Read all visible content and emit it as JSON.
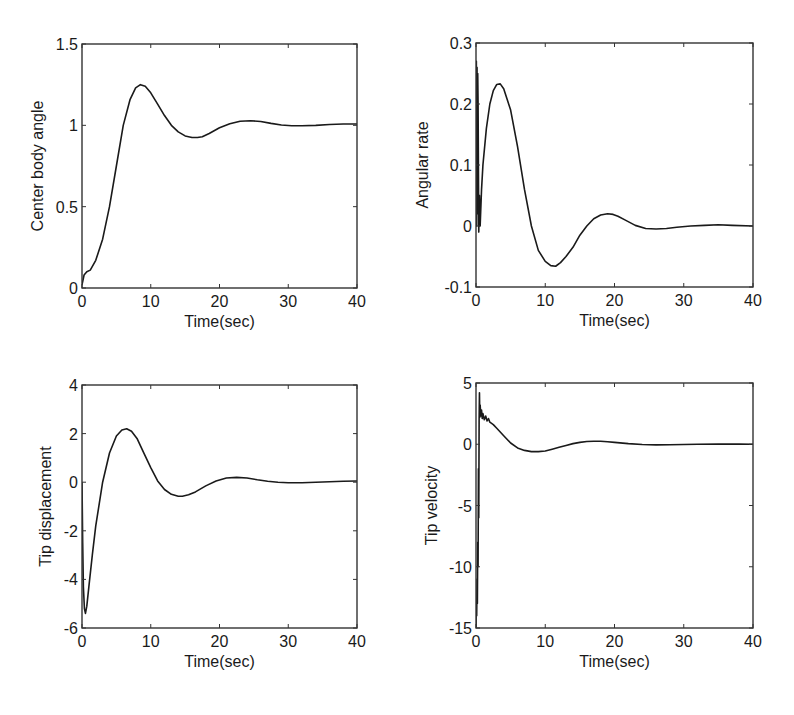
{
  "figure": {
    "line_color": "#1a1a1a",
    "axes_color": "#333333",
    "background": "#ffffff"
  },
  "chart_data": [
    {
      "id": "center_body_angle",
      "type": "line",
      "title": "",
      "xlabel": "Time(sec)",
      "ylabel": "Center body angle",
      "xlim": [
        0,
        40
      ],
      "ylim": [
        0,
        1.5
      ],
      "xticks": [
        0,
        10,
        20,
        30,
        40
      ],
      "xtick_labels": [
        "0",
        "10",
        "20",
        "30",
        "40"
      ],
      "yticks": [
        0,
        0.5,
        1,
        1.5
      ],
      "ytick_labels": [
        "0",
        "0.5",
        "1",
        "1.5"
      ],
      "grid": false,
      "box": {
        "left": 82,
        "top": 44,
        "right": 357,
        "bottom": 288
      },
      "series": [
        {
          "name": "Center body angle",
          "x": [
            0,
            0.3,
            0.7,
            1.2,
            2,
            3,
            4,
            5,
            6,
            7,
            7.8,
            8.5,
            9.2,
            10,
            11,
            12,
            13,
            14,
            15,
            16,
            16.8,
            17.5,
            18.5,
            20,
            21.5,
            23,
            24.5,
            26,
            27.5,
            29,
            30.5,
            32,
            34,
            36,
            38,
            40
          ],
          "y": [
            0.02,
            0.08,
            0.1,
            0.11,
            0.17,
            0.3,
            0.5,
            0.75,
            1.0,
            1.16,
            1.23,
            1.25,
            1.24,
            1.2,
            1.13,
            1.06,
            1.0,
            0.96,
            0.935,
            0.925,
            0.925,
            0.93,
            0.95,
            0.985,
            1.01,
            1.025,
            1.028,
            1.024,
            1.012,
            1.002,
            0.997,
            0.997,
            1.0,
            1.005,
            1.008,
            1.008
          ]
        }
      ]
    },
    {
      "id": "angular_rate",
      "type": "line",
      "title": "",
      "xlabel": "Time(sec)",
      "ylabel": "Angular rate",
      "xlim": [
        0,
        40
      ],
      "ylim": [
        -0.1,
        0.3
      ],
      "xticks": [
        0,
        10,
        20,
        30,
        40
      ],
      "xtick_labels": [
        "0",
        "10",
        "20",
        "30",
        "40"
      ],
      "yticks": [
        -0.1,
        0,
        0.1,
        0.2,
        0.3
      ],
      "ytick_labels": [
        "-0.1",
        "0",
        "0.1",
        "0.2",
        "0.3"
      ],
      "grid": false,
      "box": {
        "left": 476,
        "top": 43,
        "right": 753,
        "bottom": 287
      },
      "series": [
        {
          "name": "Angular rate",
          "x": [
            0,
            0.05,
            0.1,
            0.15,
            0.2,
            0.25,
            0.3,
            0.4,
            0.5,
            0.6,
            0.8,
            1.0,
            1.5,
            2,
            2.5,
            3,
            3.5,
            4,
            5,
            6,
            7,
            8,
            9,
            10,
            10.8,
            11.5,
            12.2,
            13,
            14,
            15,
            16,
            17,
            18,
            19,
            19.8,
            20.5,
            21.5,
            23,
            24.5,
            26,
            27.5,
            29,
            31,
            33,
            35,
            37,
            40
          ],
          "y": [
            0.0,
            0.27,
            0.0,
            0.26,
            0.02,
            0.25,
            0.2,
            -0.01,
            0.05,
            0.0,
            0.06,
            0.1,
            0.16,
            0.2,
            0.222,
            0.232,
            0.233,
            0.225,
            0.19,
            0.13,
            0.06,
            0.0,
            -0.04,
            -0.058,
            -0.065,
            -0.066,
            -0.06,
            -0.05,
            -0.035,
            -0.015,
            0.0,
            0.012,
            0.018,
            0.02,
            0.019,
            0.016,
            0.01,
            0.001,
            -0.004,
            -0.005,
            -0.004,
            -0.002,
            0.0,
            0.001,
            0.002,
            0.001,
            0.0
          ]
        }
      ]
    },
    {
      "id": "tip_displacement",
      "type": "line",
      "title": "",
      "xlabel": "Time(sec)",
      "ylabel": "Tip displacement",
      "xlim": [
        0,
        40
      ],
      "ylim": [
        -6,
        4
      ],
      "xticks": [
        0,
        10,
        20,
        30,
        40
      ],
      "xtick_labels": [
        "0",
        "10",
        "20",
        "30",
        "40"
      ],
      "yticks": [
        -6,
        -4,
        -2,
        0,
        2,
        4
      ],
      "ytick_labels": [
        "-6",
        "-4",
        "-2",
        "0",
        "2",
        "4"
      ],
      "grid": false,
      "box": {
        "left": 82,
        "top": 385,
        "right": 357,
        "bottom": 628
      },
      "series": [
        {
          "name": "Tip displacement",
          "x": [
            0,
            0.1,
            0.2,
            0.35,
            0.5,
            0.7,
            1.0,
            1.5,
            2,
            3,
            4,
            5,
            5.8,
            6.5,
            7.2,
            8,
            9,
            10,
            11,
            12,
            13,
            14,
            14.6,
            15.5,
            16.5,
            18,
            19.5,
            21,
            22.5,
            24,
            25.5,
            27,
            28.5,
            30,
            32,
            34,
            36,
            38,
            40
          ],
          "y": [
            0.0,
            -2.5,
            -4.3,
            -5.2,
            -5.4,
            -5.1,
            -4.3,
            -3.0,
            -1.8,
            0.0,
            1.2,
            1.9,
            2.15,
            2.2,
            2.1,
            1.8,
            1.2,
            0.6,
            0.05,
            -0.3,
            -0.5,
            -0.58,
            -0.58,
            -0.52,
            -0.4,
            -0.15,
            0.05,
            0.17,
            0.2,
            0.17,
            0.1,
            0.04,
            0.0,
            -0.02,
            -0.02,
            0.0,
            0.02,
            0.04,
            0.05
          ]
        }
      ]
    },
    {
      "id": "tip_velocity",
      "type": "line",
      "title": "",
      "xlabel": "Time(sec)",
      "ylabel": "Tip velocity",
      "xlim": [
        0,
        40
      ],
      "ylim": [
        -15,
        5
      ],
      "xticks": [
        0,
        10,
        20,
        30,
        40
      ],
      "xtick_labels": [
        "0",
        "10",
        "20",
        "30",
        "40"
      ],
      "yticks": [
        -15,
        -10,
        -5,
        0,
        5
      ],
      "ytick_labels": [
        "-15",
        "-10",
        "-5",
        "0",
        "5"
      ],
      "grid": false,
      "box": {
        "left": 476,
        "top": 383,
        "right": 753,
        "bottom": 628
      },
      "series": [
        {
          "name": "Tip velocity",
          "x": [
            0,
            0.05,
            0.1,
            0.15,
            0.2,
            0.25,
            0.3,
            0.35,
            0.4,
            0.45,
            0.5,
            0.55,
            0.6,
            0.7,
            0.8,
            0.9,
            1.0,
            1.2,
            1.4,
            1.6,
            1.8,
            2.0,
            2.5,
            3,
            4,
            5,
            6,
            7,
            8,
            9,
            10,
            11,
            12,
            13,
            14,
            15,
            16,
            17,
            18,
            19,
            20,
            22,
            24,
            26,
            28,
            30,
            32,
            35,
            38,
            40
          ],
          "y": [
            -15,
            -13,
            -14,
            -11,
            -13,
            -8,
            -10,
            -2,
            -6,
            2,
            4.2,
            2.2,
            3.2,
            2.3,
            2.8,
            2.1,
            2.5,
            2.0,
            2.3,
            1.9,
            2.1,
            1.8,
            1.6,
            1.3,
            0.7,
            0.1,
            -0.3,
            -0.5,
            -0.6,
            -0.6,
            -0.55,
            -0.4,
            -0.25,
            -0.1,
            0.05,
            0.15,
            0.22,
            0.25,
            0.25,
            0.2,
            0.15,
            0.05,
            -0.02,
            -0.05,
            -0.04,
            -0.02,
            0.0,
            0.01,
            0.01,
            0.0
          ]
        }
      ]
    }
  ]
}
